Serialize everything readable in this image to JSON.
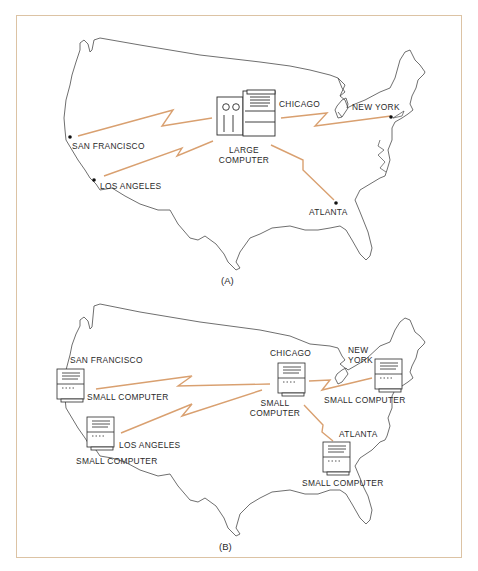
{
  "figure": {
    "panel_a": {
      "caption": "(A)",
      "labels": {
        "san_francisco": "SAN FRANCISCO",
        "los_angeles": "LOS ANGELES",
        "chicago": "CHICAGO",
        "new_york": "NEW YORK",
        "atlanta": "ATLANTA",
        "large_computer_line1": "LARGE",
        "large_computer_line2": "COMPUTER"
      }
    },
    "panel_b": {
      "caption": "(B)",
      "labels": {
        "san_francisco": "SAN FRANCISCO",
        "sf_computer": "SMALL COMPUTER",
        "los_angeles": "LOS ANGELES",
        "la_computer": "SMALL COMPUTER",
        "chicago": "CHICAGO",
        "chicago_computer_line1": "SMALL",
        "chicago_computer_line2": "COMPUTER",
        "new_york_line1": "NEW",
        "new_york_line2": "YORK",
        "ny_computer": "SMALL COMPUTER",
        "atlanta": "ATLANTA",
        "atlanta_computer": "SMALL COMPUTER"
      }
    },
    "colors": {
      "link": "#d9a070",
      "outline": "#4a4a4a",
      "frame": "#dcc3a4"
    }
  }
}
